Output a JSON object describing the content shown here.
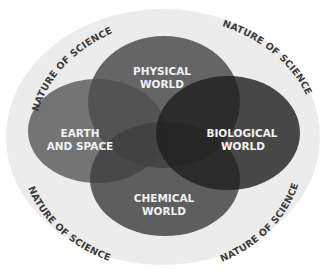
{
  "diagram": {
    "type": "venn",
    "ring_label": "NATURE OF SCIENCE",
    "ring_labels": [
      {
        "position": "top-left",
        "text": "NATURE OF SCIENCE"
      },
      {
        "position": "top-right",
        "text": "NATURE OF SCIENCE"
      },
      {
        "position": "bottom-left",
        "text": "NATURE OF SCIENCE"
      },
      {
        "position": "bottom-right",
        "text": "NATURE OF SCIENCE"
      }
    ],
    "sets": [
      {
        "id": "physical",
        "line1": "PHYSICAL",
        "line2": "WORLD",
        "color": "#5c5c5c"
      },
      {
        "id": "earth",
        "line1": "EARTH",
        "line2": "AND SPACE",
        "color": "#6e6e6e"
      },
      {
        "id": "biological",
        "line1": "BIOLOGICAL",
        "line2": "WORLD",
        "color": "#2f2f2f"
      },
      {
        "id": "chemical",
        "line1": "CHEMICAL",
        "line2": "WORLD",
        "color": "#4a4a4a"
      }
    ],
    "ring_color": "#ececec"
  }
}
